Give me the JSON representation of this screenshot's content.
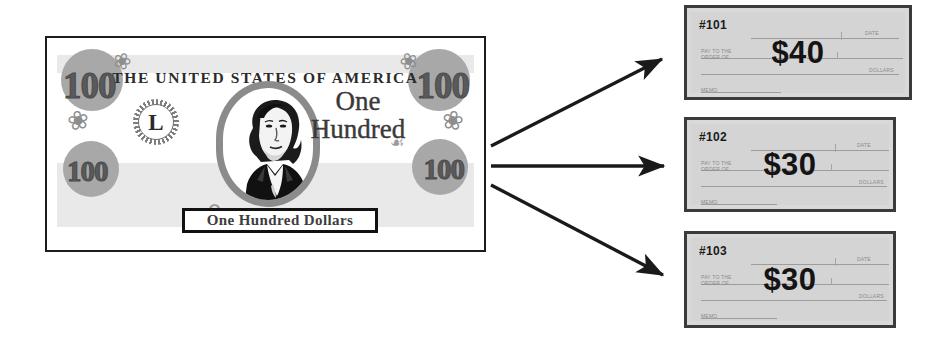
{
  "diagram": {
    "title_semantic": "one-hundred-dollar-bill-split-into-three-checks",
    "colors": {
      "bill_frame": "#1c1c1c",
      "bill_ornament_gray": "#a8a8a8",
      "check_background": "#d4d4d4",
      "check_border": "#3b3b3b",
      "arrow": "#1a1a1a",
      "page_background": "#ffffff"
    }
  },
  "bill": {
    "country_line": "THE UNITED STATES OF AMERICA",
    "seal_letter": "L",
    "denomination_word_line1": "One",
    "denomination_word_line2": "Hundred",
    "banner_text": "One Hundred Dollars",
    "corner_numerals": [
      "100",
      "100",
      "100",
      "100"
    ],
    "portrait_name": "george-washington-portrait",
    "flourish_glyphs": [
      "❀",
      "❀",
      "❀",
      "❀",
      "ʕ",
      "☙"
    ]
  },
  "arrows": [
    {
      "name": "arrow-to-check-101",
      "from_x": 491,
      "from_y": 146,
      "to_x": 666,
      "to_y": 57
    },
    {
      "name": "arrow-to-check-102",
      "from_x": 491,
      "from_y": 166,
      "to_x": 668,
      "to_y": 166
    },
    {
      "name": "arrow-to-check-103",
      "from_x": 491,
      "from_y": 185,
      "to_x": 668,
      "to_y": 277
    }
  ],
  "checks": [
    {
      "number": "#101",
      "amount": "$40",
      "memo_label": "PAY TO THE\nORDER OF",
      "date_label": "DATE",
      "memo_bottom_label": "MEMO",
      "dollars_label": "DOLLARS"
    },
    {
      "number": "#102",
      "amount": "$30",
      "memo_label": "PAY TO THE\nORDER OF",
      "date_label": "DATE",
      "memo_bottom_label": "MEMO",
      "dollars_label": "DOLLARS"
    },
    {
      "number": "#103",
      "amount": "$30",
      "memo_label": "PAY TO THE\nORDER OF",
      "date_label": "DATE",
      "memo_bottom_label": "MEMO",
      "dollars_label": "DOLLARS"
    }
  ]
}
